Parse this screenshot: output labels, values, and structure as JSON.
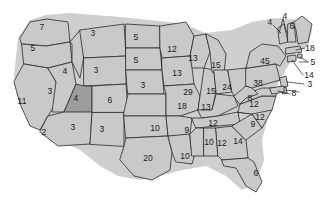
{
  "figure": {
    "name": "us-electoral-college-map",
    "type": "choropleth-map",
    "region": "United States",
    "background_color": "#ffffff",
    "state_fill": "#c9c9c9",
    "highlight_fill": "#9d9d9d",
    "border_color": "#2b2b2b",
    "label_color": "#1a1a1a"
  },
  "chart_data": {
    "type": "map",
    "title": "",
    "xlabel": "",
    "ylabel": "",
    "legend": [],
    "categories": [
      "WA",
      "OR",
      "CA",
      "NV",
      "ID",
      "MT",
      "WY",
      "UT",
      "AZ",
      "NM",
      "CO",
      "ND",
      "SD",
      "NE",
      "KS",
      "OK",
      "TX",
      "MN",
      "IA",
      "MO",
      "AR",
      "LA",
      "WI",
      "IL",
      "MI",
      "IN",
      "OH",
      "KY",
      "TN",
      "MS",
      "AL",
      "GA",
      "FL",
      "SC",
      "NC",
      "VA",
      "WV",
      "PA",
      "NY",
      "VT",
      "NH",
      "ME",
      "MA",
      "RI",
      "CT",
      "NJ",
      "DE",
      "MD"
    ],
    "values": [
      7,
      5,
      11,
      3,
      4,
      3,
      3,
      4,
      2,
      3,
      6,
      5,
      5,
      3,
      3,
      10,
      20,
      12,
      13,
      29,
      9,
      10,
      13,
      15,
      15,
      24,
      24,
      13,
      12,
      10,
      12,
      14,
      6,
      9,
      12,
      12,
      8,
      38,
      45,
      4,
      4,
      6,
      18,
      5,
      14,
      14,
      3,
      8
    ]
  },
  "labels": [
    {
      "id": "wa",
      "value": "7",
      "x": 42,
      "y": 27
    },
    {
      "id": "or",
      "value": "5",
      "x": 33,
      "y": 48
    },
    {
      "id": "ca",
      "value": "11",
      "x": 22,
      "y": 101
    },
    {
      "id": "nv",
      "value": "3",
      "x": 50,
      "y": 91
    },
    {
      "id": "id",
      "value": "4",
      "x": 65,
      "y": 71
    },
    {
      "id": "mt",
      "value": "3",
      "x": 93,
      "y": 33
    },
    {
      "id": "wy",
      "value": "3",
      "x": 96,
      "y": 70
    },
    {
      "id": "ut",
      "value": "4",
      "x": 76,
      "y": 98
    },
    {
      "id": "az",
      "value": "2",
      "x": 44,
      "y": 132
    },
    {
      "id": "nm",
      "value": "3",
      "x": 73,
      "y": 127
    },
    {
      "id": "co",
      "value": "6",
      "x": 110,
      "y": 100
    },
    {
      "id": "nd",
      "value": "5",
      "x": 136,
      "y": 37
    },
    {
      "id": "sd",
      "value": "5",
      "x": 136,
      "y": 60
    },
    {
      "id": "ne",
      "value": "3",
      "x": 143,
      "y": 85
    },
    {
      "id": "ks",
      "value": "3",
      "x": 102,
      "y": 129
    },
    {
      "id": "ok",
      "value": "10",
      "x": 155,
      "y": 128
    },
    {
      "id": "tx",
      "value": "20",
      "x": 148,
      "y": 158
    },
    {
      "id": "mn",
      "value": "12",
      "x": 172,
      "y": 49
    },
    {
      "id": "wi",
      "value": "13",
      "x": 193,
      "y": 58
    },
    {
      "id": "ia",
      "value": "13",
      "x": 177,
      "y": 73
    },
    {
      "id": "mo",
      "value": "29",
      "x": 188,
      "y": 92
    },
    {
      "id": "ar",
      "value": "18",
      "x": 182,
      "y": 106
    },
    {
      "id": "la",
      "value": "9",
      "x": 187,
      "y": 130
    },
    {
      "id": "ms",
      "value": "10",
      "x": 185,
      "y": 156
    },
    {
      "id": "il",
      "value": "15",
      "x": 211,
      "y": 91
    },
    {
      "id": "mi",
      "value": "15",
      "x": 216,
      "y": 65
    },
    {
      "id": "in",
      "value": "24",
      "x": 227,
      "y": 87
    },
    {
      "id": "oh",
      "value": "13",
      "x": 206,
      "y": 107
    },
    {
      "id": "ky",
      "value": "12",
      "x": 213,
      "y": 123
    },
    {
      "id": "tn",
      "value": "10",
      "x": 209,
      "y": 142
    },
    {
      "id": "al",
      "value": "12",
      "x": 222,
      "y": 143
    },
    {
      "id": "ga",
      "value": "14",
      "x": 238,
      "y": 141
    },
    {
      "id": "fl",
      "value": "6",
      "x": 256,
      "y": 173
    },
    {
      "id": "sc",
      "value": "9",
      "x": 253,
      "y": 124
    },
    {
      "id": "nc",
      "value": "12",
      "x": 254,
      "y": 104
    },
    {
      "id": "va",
      "value": "12",
      "x": 260,
      "y": 117
    },
    {
      "id": "wv",
      "value": "8",
      "x": 250,
      "y": 98
    },
    {
      "id": "pa",
      "value": "38",
      "x": 258,
      "y": 83
    },
    {
      "id": "ny",
      "value": "45",
      "x": 265,
      "y": 61
    },
    {
      "id": "me",
      "value": "6",
      "x": 292,
      "y": 26
    },
    {
      "id": "vt",
      "value": "4",
      "x": 270,
      "y": 22
    },
    {
      "id": "nh",
      "value": "4",
      "x": 285,
      "y": 16
    },
    {
      "id": "ma",
      "value": "18",
      "x": 310,
      "y": 48
    },
    {
      "id": "ri",
      "value": "5",
      "x": 313,
      "y": 62
    },
    {
      "id": "ct",
      "value": "14",
      "x": 309,
      "y": 75
    },
    {
      "id": "nj",
      "value": "3",
      "x": 310,
      "y": 84
    },
    {
      "id": "de",
      "value": "8",
      "x": 294,
      "y": 93
    }
  ]
}
